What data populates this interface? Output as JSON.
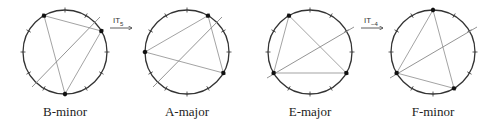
{
  "diagram": {
    "circle_radius": 42,
    "tick_count": 12,
    "colors": {
      "circle": "#333333",
      "ticks": "#333333",
      "triangle": "#999999",
      "axis": "#888888",
      "vertex": "#111111"
    },
    "chords": [
      {
        "label": "B-minor",
        "cx": 65,
        "cy": 52,
        "vertices": [
          11,
          2,
          6
        ],
        "axis": [
          [
            32,
            87
          ],
          [
            100,
            17
          ]
        ]
      },
      {
        "label": "A-major",
        "cx": 187,
        "cy": 52,
        "vertices": [
          9,
          1,
          4
        ],
        "axis": [
          [
            153,
            87
          ],
          [
            222,
            17
          ]
        ]
      },
      {
        "label": "E-major",
        "cx": 310,
        "cy": 52,
        "vertices": [
          11,
          8,
          4
        ],
        "axis": [
          [
            267,
            78
          ],
          [
            354,
            27
          ]
        ]
      },
      {
        "label": "F-minor",
        "cx": 433,
        "cy": 52,
        "vertices": [
          0,
          8,
          5
        ],
        "axis": [
          [
            390,
            78
          ],
          [
            477,
            27
          ]
        ]
      }
    ],
    "transformations": [
      {
        "label": "IT",
        "subscript": "5",
        "x": 110,
        "y": 28,
        "from": "B-minor",
        "to": "A-major"
      },
      {
        "label": "IT",
        "subscript": "−4",
        "x": 361,
        "y": 28,
        "from": "E-major",
        "to": "F-minor"
      }
    ]
  }
}
